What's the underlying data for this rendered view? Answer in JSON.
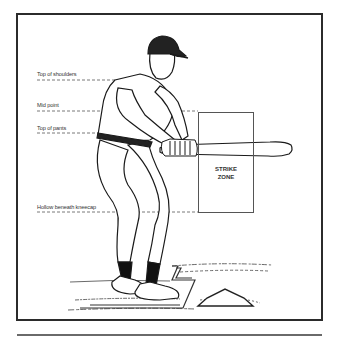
{
  "figure": {
    "labels": [
      {
        "id": "top-of-shoulders",
        "text": "Top of shoulders"
      },
      {
        "id": "mid-point",
        "text": "Mid point"
      },
      {
        "id": "top-of-pants",
        "text": "Top of pants"
      },
      {
        "id": "hollow-beneath-kneecap",
        "text": "Hollow beneath kneecap"
      }
    ],
    "strike_zone": {
      "line1": "STRIKE",
      "line2": "ZONE"
    }
  },
  "colors": {
    "ink": "#2b2b2b",
    "background": "#ffffff",
    "rule": "#6a6a6a"
  }
}
